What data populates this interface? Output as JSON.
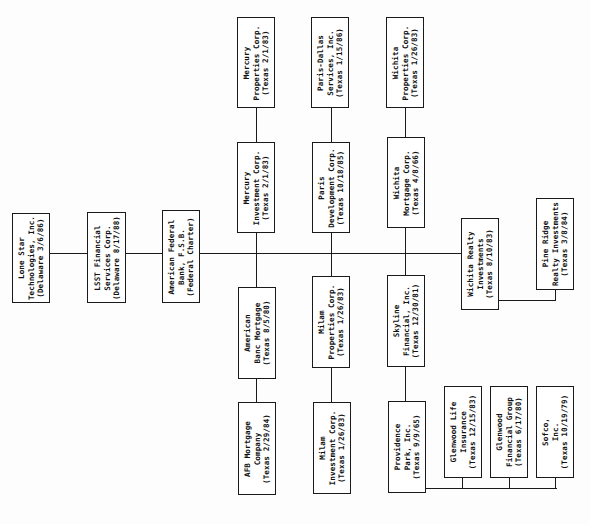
{
  "diagram": {
    "type": "org-chart",
    "orientation": "rotated-90-ccw",
    "line_color": "#1a1a1a",
    "entities": {
      "lone_star": {
        "name": "Lone Star",
        "name2": "Technologies, Inc.",
        "jurisdiction": "(Delaware 3/6/86)"
      },
      "lsst": {
        "name": "LSST Financial",
        "name2": "Services Corp.",
        "jurisdiction": "(Delaware 8/17/88)"
      },
      "american_federal": {
        "name": "American Federal",
        "name2": "Bank, F.S.B.",
        "jurisdiction": "(Federal Charter)"
      },
      "mercury_properties": {
        "name": "Mercury",
        "name2": "Properties Corp.",
        "jurisdiction": "(Texas 2/1/83)"
      },
      "mercury_investment": {
        "name": "Mercury",
        "name2": "Investment Corp.",
        "jurisdiction": "(Texas 2/1/83)"
      },
      "american_banc": {
        "name": "American",
        "name2": "Banc Mortgage",
        "jurisdiction": "(Texas 8/5/80)"
      },
      "afb_mortgage": {
        "name": "AFB Mortgage",
        "name2": "Company",
        "jurisdiction": "(Texas 2/29/84)"
      },
      "paris_dallas": {
        "name": "Paris-Dallas",
        "name2": "Services, Inc.",
        "jurisdiction": "(Texas 1/15/86)"
      },
      "paris_development": {
        "name": "Paris",
        "name2": "Development Corp.",
        "jurisdiction": "(Texas 10/18/85)"
      },
      "milam_properties": {
        "name": "Milam",
        "name2": "Properties Corp.",
        "jurisdiction": "(Texas 1/26/83)"
      },
      "milam_investment": {
        "name": "Milam",
        "name2": "Investment Corp.",
        "jurisdiction": "(Texas 1/26/83)"
      },
      "wichita_properties": {
        "name": "Wichita",
        "name2": "Properties Corp.",
        "jurisdiction": "(Texas 1/26/83)"
      },
      "wichita_mortgage": {
        "name": "Wichita",
        "name2": "Mortgage Corp.",
        "jurisdiction": "(Texas 4/8/66)"
      },
      "skyline": {
        "name": "Skyline",
        "name2": "Financial, Inc.",
        "jurisdiction": "(Texas 12/30/81)"
      },
      "providence_park": {
        "name": "Providence",
        "name2": "Park, Inc.",
        "jurisdiction": "(Texas 9/9/65)"
      },
      "wichita_realty": {
        "name": "Wichita Realty",
        "name2": "Investments",
        "jurisdiction": "(Texas 8/10/83)"
      },
      "pine_ridge": {
        "name": "Pine Ridge",
        "name2": "Realty Investments",
        "jurisdiction": "(Texas 3/8/84)"
      },
      "glenwood_life": {
        "name": "Glenwood Life",
        "name2": "Insurance",
        "jurisdiction": "(Texas 12/15/83)"
      },
      "glenwood_financial": {
        "name": "Glenwood",
        "name2": "Financial Group",
        "jurisdiction": "(Texas 6/17/80)"
      },
      "sofco": {
        "name": "Sofco,",
        "name2": "Inc.",
        "jurisdiction": "(Texas 10/19/79)"
      }
    },
    "relationships": [
      [
        "lone_star",
        "lsst"
      ],
      [
        "lsst",
        "american_federal"
      ],
      [
        "american_federal",
        "mercury_investment"
      ],
      [
        "american_federal",
        "american_banc"
      ],
      [
        "american_federal",
        "paris_development"
      ],
      [
        "american_federal",
        "milam_properties"
      ],
      [
        "american_federal",
        "wichita_mortgage"
      ],
      [
        "american_federal",
        "skyline"
      ],
      [
        "american_federal",
        "wichita_realty"
      ],
      [
        "mercury_investment",
        "mercury_properties"
      ],
      [
        "american_banc",
        "afb_mortgage"
      ],
      [
        "paris_development",
        "paris_dallas"
      ],
      [
        "milam_properties",
        "milam_investment"
      ],
      [
        "wichita_mortgage",
        "wichita_properties"
      ],
      [
        "skyline",
        "providence_park"
      ],
      [
        "wichita_realty",
        "pine_ridge"
      ],
      [
        "providence_park",
        "glenwood_life"
      ],
      [
        "providence_park",
        "glenwood_financial"
      ],
      [
        "providence_park",
        "sofco"
      ]
    ]
  }
}
